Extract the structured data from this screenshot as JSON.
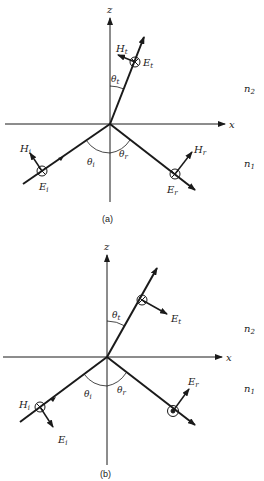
{
  "figure": {
    "panels": [
      {
        "id": "a",
        "caption": "(a)",
        "axes": {
          "x_label": "x",
          "z_label": "z"
        },
        "media": {
          "upper": "n",
          "upper_sub": "2",
          "lower": "n",
          "lower_sub": "1"
        },
        "angles": {
          "incident": "θ",
          "incident_sub": "i",
          "reflected": "θ",
          "reflected_sub": "r",
          "transmitted": "θ",
          "transmitted_sub": "t"
        },
        "fields": {
          "incident": {
            "E": "E",
            "E_sub": "i",
            "H": "H",
            "H_sub": "i",
            "E_symbol": "into-page"
          },
          "reflected": {
            "E": "E",
            "E_sub": "r",
            "H": "H",
            "H_sub": "r",
            "E_symbol": "into-page"
          },
          "transmitted": {
            "E": "E",
            "E_sub": "t",
            "H": "H",
            "H_sub": "t",
            "E_symbol": "into-page"
          }
        },
        "polarization": "TE (s)"
      },
      {
        "id": "b",
        "caption": "(b)",
        "axes": {
          "x_label": "x",
          "z_label": "z"
        },
        "media": {
          "upper": "n",
          "upper_sub": "2",
          "lower": "n",
          "lower_sub": "1"
        },
        "angles": {
          "incident": "θ",
          "incident_sub": "i",
          "reflected": "θ",
          "reflected_sub": "r",
          "transmitted": "θ",
          "transmitted_sub": "t"
        },
        "fields": {
          "incident": {
            "E": "E",
            "E_sub": "i",
            "H": "H",
            "H_sub": "i",
            "H_symbol": "into-page"
          },
          "reflected": {
            "E": "E",
            "E_sub": "r",
            "H_symbol": "out-of-page"
          },
          "transmitted": {
            "E": "E",
            "E_sub": "t",
            "H_symbol": "into-page"
          }
        },
        "polarization": "TM (p)"
      }
    ],
    "colors": {
      "ink": "#1a1a1a",
      "background": "#ffffff"
    }
  }
}
